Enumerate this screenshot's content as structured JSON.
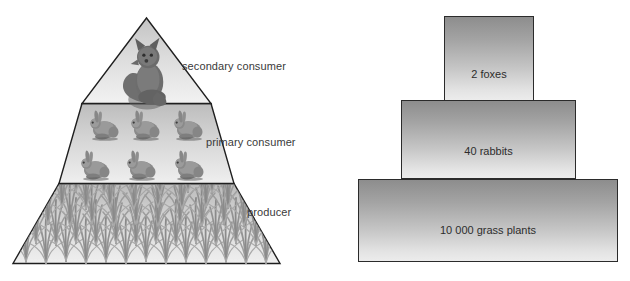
{
  "diagram": {
    "pyramid": {
      "name": "trophic-level-pyramid",
      "levels": [
        {
          "id": "secondary",
          "label": "secondary consumer",
          "organism": "fox",
          "count": 1
        },
        {
          "id": "primary",
          "label": "primary consumer",
          "organism": "rabbit",
          "count": 6
        },
        {
          "id": "producer",
          "label": "producer",
          "organism": "grass",
          "count": 0
        }
      ]
    },
    "bar_pyramid": {
      "name": "numbers-bar-pyramid",
      "bars": [
        {
          "id": "foxes",
          "label": "2 foxes",
          "value": 2,
          "unit": "foxes"
        },
        {
          "id": "rabbits",
          "label": "40 rabbits",
          "value": 40,
          "unit": "rabbits"
        },
        {
          "id": "grass",
          "label": "10 000 grass plants",
          "value": 10000,
          "unit": "grass plants"
        }
      ]
    },
    "colors": {
      "outline": "#2b2b2b",
      "label_text": "#3a3a3a",
      "bar_text": "#2d2d2d",
      "fill_dark": "#8d8d8d",
      "fill_light": "#ececec",
      "background": "#ffffff"
    }
  }
}
